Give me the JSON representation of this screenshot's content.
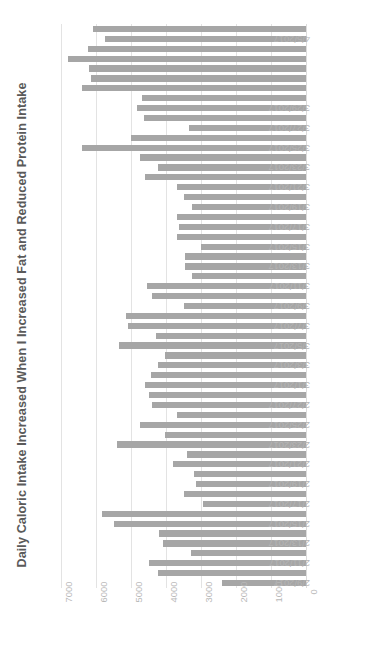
{
  "chart_data": {
    "type": "bar",
    "orientation": "horizontal",
    "title": "Daily Caloric Intake Increased When I Increased Fat and Reduced Protein Intake",
    "xlabel": "",
    "ylabel": "",
    "xlim": [
      7500,
      0
    ],
    "x_axis_reversed": true,
    "grid": true,
    "legend": false,
    "bar_color": "#a6a6a6",
    "gridline_color": "#e3e3e3",
    "tick_label_color": "#b8b8b8",
    "title_color": "#5a5a5a",
    "xticks": [
      7000,
      6000,
      5000,
      4000,
      3000,
      2000,
      1000,
      0
    ],
    "xtick_labels": [
      "7000",
      "6000",
      "5000",
      "4000",
      "3000",
      "2000",
      "1000",
      "0"
    ],
    "categories": [
      "4/6/2017",
      "4/5/2017",
      "4/4/2017",
      "4/3/2017",
      "4/2/2017",
      "4/1/2017",
      "3/31/2017",
      "3/30/2017",
      "3/29/2017",
      "3/28/2017",
      "3/27/2017",
      "3/26/2017",
      "3/25/2017",
      "3/24/2017",
      "3/23/2017",
      "3/22/2017",
      "3/21/2017",
      "3/20/2017",
      "3/19/2017",
      "3/18/2017",
      "3/17/2017",
      "3/16/2017",
      "3/15/2017",
      "3/14/2017",
      "3/13/2017",
      "3/12/2017",
      "3/11/2017",
      "3/10/2017",
      "3/9/2017",
      "3/8/2017",
      "3/7/2017",
      "3/6/2017",
      "3/5/2017",
      "3/4/2017",
      "3/3/2017",
      "3/2/2017",
      "3/1/2017",
      "2/28/2017",
      "2/27/2017",
      "2/26/2017",
      "2/25/2017",
      "2/24/2017",
      "2/23/2017",
      "2/22/2017",
      "2/21/2017",
      "2/20/2017",
      "2/19/2017",
      "2/18/2017",
      "2/17/2017",
      "2/16/2017",
      "2/15/2017",
      "2/14/2017",
      "2/13/2017",
      "2/12/2017",
      "2/11/2017",
      "2/10/2017",
      "2/9/2017"
    ],
    "visible_category_labels": [
      "4/5/2017",
      "3/29/2017",
      "3/27/2017",
      "3/25/2017",
      "3/23/2017",
      "3/21/2017",
      "3/19/2017",
      "3/17/2017",
      "3/15/2017",
      "3/13/2017",
      "3/11/2017",
      "3/9/2017",
      "3/7/2017",
      "3/5/2017",
      "3/3/2017",
      "3/1/2017",
      "2/27/2017",
      "2/25/2017",
      "2/23/2017",
      "2/21/2017",
      "2/19/2017",
      "2/17/2017",
      "2/15/2017",
      "2/13/2017",
      "2/11/2017",
      "2/9/2017"
    ],
    "values": [
      6100,
      5750,
      6250,
      6800,
      6200,
      6150,
      6400,
      4700,
      4850,
      4650,
      3350,
      5000,
      6400,
      4750,
      4250,
      4600,
      3700,
      3500,
      3250,
      3700,
      3650,
      3700,
      3000,
      3450,
      3450,
      3250,
      4550,
      4400,
      3500,
      5150,
      5100,
      4300,
      5350,
      4050,
      4250,
      4450,
      4600,
      4500,
      4400,
      3700,
      4750,
      4050,
      5400,
      3400,
      3800,
      3200,
      3150,
      3500,
      2950,
      5850,
      5500,
      4200,
      4100,
      3300,
      4500,
      4250,
      2400
    ]
  }
}
